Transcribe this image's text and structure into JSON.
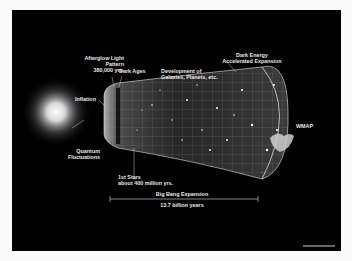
{
  "diagram": {
    "labels": {
      "afterglow_line1": "Afterglow Light",
      "afterglow_line2": "Pattern",
      "afterglow_line3": "380,000 yrs.",
      "dark_ages": "Dark Ages",
      "development_line1": "Development of",
      "development_line2": "Galaxies, Planets, etc.",
      "dark_energy_line1": "Dark Energy",
      "dark_energy_line2": "Accelerated Expansion",
      "inflation": "Inflation",
      "quantum_line1": "Quantum",
      "quantum_line2": "Fluctuations",
      "first_stars_line1": "1st Stars",
      "first_stars_line2": "about 400 million yrs.",
      "big_bang_expansion": "Big Bang Expansion",
      "duration": "13.7 billion years",
      "wmap": "WMAP"
    },
    "colors": {
      "background": "#000000",
      "frame": "#fafafa",
      "text": "#e8e8e8",
      "glow": "#ffffff"
    }
  }
}
